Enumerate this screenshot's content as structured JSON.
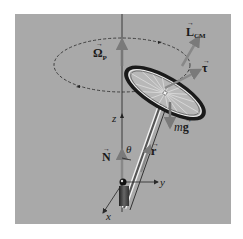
{
  "diagram": {
    "background_color": "#a9a9a9",
    "vectors": {
      "angular_momentum": {
        "symbol": "L",
        "subscript": "CM",
        "arrow": "→"
      },
      "torque": {
        "symbol": "τ",
        "arrow": "→"
      },
      "precession": {
        "symbol": "Ω",
        "subscript": "P",
        "arrow": "→"
      },
      "weight": {
        "prefix": "m",
        "symbol": "g",
        "arrow": "→"
      },
      "normal": {
        "symbol": "N",
        "arrow": "→"
      },
      "position": {
        "symbol": "r",
        "arrow": "→"
      }
    },
    "angle_label": "θ",
    "axes": {
      "x": "x",
      "y": "y",
      "z": "z"
    }
  }
}
